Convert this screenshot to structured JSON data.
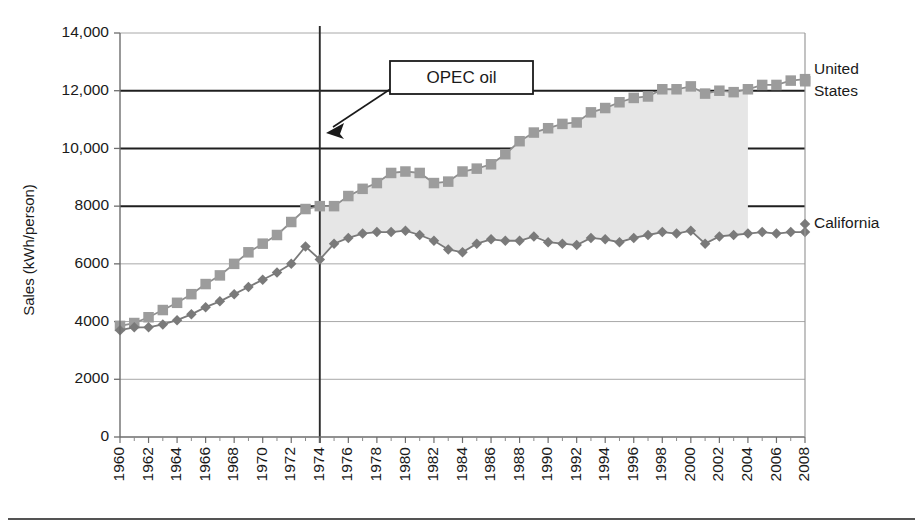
{
  "chart_data": {
    "type": "line",
    "title": "",
    "xlabel": "",
    "ylabel": "Sales (kWh/person)",
    "xlim": [
      1960,
      2008
    ],
    "ylim": [
      0,
      14000
    ],
    "ytick_labels": [
      "0",
      "2000",
      "4000",
      "6000",
      "8000",
      "10,000",
      "12,000",
      "14,000"
    ],
    "ytick_values": [
      0,
      2000,
      4000,
      6000,
      8000,
      10000,
      12000,
      14000
    ],
    "xtick_labels": [
      "1960",
      "1962",
      "1964",
      "1966",
      "1968",
      "1970",
      "1972",
      "1974",
      "1976",
      "1978",
      "1980",
      "1982",
      "1984",
      "1986",
      "1988",
      "1990",
      "1992",
      "1994",
      "1996",
      "1998",
      "2000",
      "2002",
      "2004",
      "2006",
      "2008"
    ],
    "xtick_values": [
      1960,
      1962,
      1964,
      1966,
      1968,
      1970,
      1972,
      1974,
      1976,
      1978,
      1980,
      1982,
      1984,
      1986,
      1988,
      1990,
      1992,
      1994,
      1996,
      1998,
      2000,
      2002,
      2004,
      2006,
      2008
    ],
    "grid": true,
    "legend_position": "right-inline",
    "x": [
      1960,
      1961,
      1962,
      1963,
      1964,
      1965,
      1966,
      1967,
      1968,
      1969,
      1970,
      1971,
      1972,
      1973,
      1974,
      1975,
      1976,
      1977,
      1978,
      1979,
      1980,
      1981,
      1982,
      1983,
      1984,
      1985,
      1986,
      1987,
      1988,
      1989,
      1990,
      1991,
      1992,
      1993,
      1994,
      1995,
      1996,
      1997,
      1998,
      1999,
      2000,
      2001,
      2002,
      2003,
      2004,
      2005,
      2006,
      2007,
      2008
    ],
    "series": [
      {
        "name": "United States",
        "label_line1": "United",
        "label_line2": "States",
        "marker": "square",
        "color": "#9c9c9c",
        "line_color": "#8f8f8f",
        "values": [
          3850,
          3950,
          4150,
          4400,
          4650,
          4950,
          5300,
          5600,
          6000,
          6400,
          6700,
          7000,
          7450,
          7900,
          8000,
          8000,
          8350,
          8600,
          8800,
          9150,
          9200,
          9150,
          8800,
          8850,
          9200,
          9300,
          9450,
          9800,
          10250,
          10550,
          10700,
          10850,
          10900,
          11250,
          11400,
          11600,
          11750,
          11800,
          12050,
          12050,
          12150,
          11900,
          12000,
          11950,
          12050,
          12200,
          12200,
          12350,
          12400
        ]
      },
      {
        "name": "California",
        "label_line1": "California",
        "label_line2": "",
        "marker": "diamond",
        "color": "#7a7a7a",
        "line_color": "#7a7a7a",
        "values": [
          3700,
          3800,
          3800,
          3900,
          4050,
          4250,
          4500,
          4700,
          4950,
          5200,
          5450,
          5700,
          6000,
          6600,
          6150,
          6700,
          6900,
          7050,
          7100,
          7100,
          7150,
          7000,
          6800,
          6500,
          6400,
          6700,
          6850,
          6800,
          6800,
          6950,
          6750,
          6700,
          6650,
          6900,
          6850,
          6750,
          6900,
          7000,
          7100,
          7050,
          7150,
          6700,
          6950,
          7000,
          7050,
          7100,
          7050,
          7100,
          7100
        ]
      }
    ],
    "shaded_region": {
      "label": "gap-between-us-and-california",
      "color": "#e6e6e6",
      "x_start": 1974,
      "x_end": 2004
    },
    "annotations": [
      {
        "text": "OPEC oil",
        "type": "callout-box-with-arrow",
        "points_to_year": 1974,
        "points_to_value": 10300
      }
    ],
    "vertical_marker_line": {
      "year": 1974,
      "color": "#2b2b2b"
    }
  }
}
